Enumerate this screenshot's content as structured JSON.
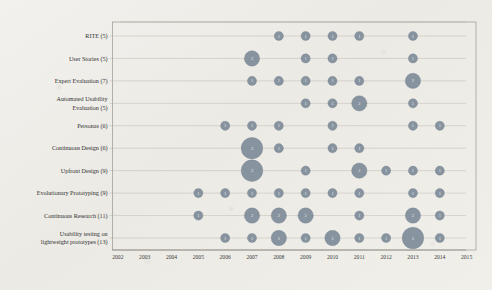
{
  "chart_data": {
    "type": "scatter",
    "subtype": "bubble",
    "title": "",
    "xlabel": "",
    "ylabel": "",
    "grid": true,
    "legend": "none",
    "x_tick_labels": [
      "2002",
      "2003",
      "2004",
      "2005",
      "2006",
      "2007",
      "2008",
      "2009",
      "2010",
      "2011",
      "2012",
      "2013",
      "2014",
      "2015"
    ],
    "xlim": [
      2002,
      2015
    ],
    "categories": [
      "RITE (5)",
      "User Stories (5)",
      "Expert Evaluation (7)",
      "Automated Usability Evaluation (5)",
      "Personas (6)",
      "Continuous Design (6)",
      "Upfront Design (9)",
      "Evolutionary Prototyping (9)",
      "Continuous Research (11)",
      "Usability testing on lightweight prototypes (13)"
    ],
    "category_lines": [
      [
        "RITE (5)"
      ],
      [
        "User Stories (5)"
      ],
      [
        "Expert Evaluation (7)"
      ],
      [
        "Automated Usability",
        "Evaluation (5)"
      ],
      [
        "Personas (6)"
      ],
      [
        "Continuous Design (6)"
      ],
      [
        "Upfront Design (9)"
      ],
      [
        "Evolutionary Prototyping (9)"
      ],
      [
        "Continuous Research (11)"
      ],
      [
        "Usability testing on",
        "lightweight prototypes (13)"
      ]
    ],
    "size_encoding": "count",
    "points": [
      {
        "category": "RITE (5)",
        "year": 2008,
        "count": 1
      },
      {
        "category": "RITE (5)",
        "year": 2009,
        "count": 1
      },
      {
        "category": "RITE (5)",
        "year": 2010,
        "count": 1
      },
      {
        "category": "RITE (5)",
        "year": 2011,
        "count": 1
      },
      {
        "category": "RITE (5)",
        "year": 2013,
        "count": 1
      },
      {
        "category": "User Stories (5)",
        "year": 2007,
        "count": 2
      },
      {
        "category": "User Stories (5)",
        "year": 2009,
        "count": 1
      },
      {
        "category": "User Stories (5)",
        "year": 2010,
        "count": 1
      },
      {
        "category": "User Stories (5)",
        "year": 2013,
        "count": 1
      },
      {
        "category": "Expert Evaluation (7)",
        "year": 2007,
        "count": 1
      },
      {
        "category": "Expert Evaluation (7)",
        "year": 2008,
        "count": 1
      },
      {
        "category": "Expert Evaluation (7)",
        "year": 2009,
        "count": 1
      },
      {
        "category": "Expert Evaluation (7)",
        "year": 2010,
        "count": 1
      },
      {
        "category": "Expert Evaluation (7)",
        "year": 2011,
        "count": 1
      },
      {
        "category": "Expert Evaluation (7)",
        "year": 2013,
        "count": 2
      },
      {
        "category": "Automated Usability Evaluation (5)",
        "year": 2009,
        "count": 1
      },
      {
        "category": "Automated Usability Evaluation (5)",
        "year": 2010,
        "count": 1
      },
      {
        "category": "Automated Usability Evaluation (5)",
        "year": 2011,
        "count": 2
      },
      {
        "category": "Automated Usability Evaluation (5)",
        "year": 2013,
        "count": 1
      },
      {
        "category": "Personas (6)",
        "year": 2006,
        "count": 1
      },
      {
        "category": "Personas (6)",
        "year": 2007,
        "count": 1
      },
      {
        "category": "Personas (6)",
        "year": 2008,
        "count": 1
      },
      {
        "category": "Personas (6)",
        "year": 2010,
        "count": 1
      },
      {
        "category": "Personas (6)",
        "year": 2013,
        "count": 1
      },
      {
        "category": "Personas (6)",
        "year": 2014,
        "count": 1
      },
      {
        "category": "Continuous Design (6)",
        "year": 2007,
        "count": 3
      },
      {
        "category": "Continuous Design (6)",
        "year": 2008,
        "count": 1
      },
      {
        "category": "Continuous Design (6)",
        "year": 2010,
        "count": 1
      },
      {
        "category": "Continuous Design (6)",
        "year": 2011,
        "count": 1
      },
      {
        "category": "Upfront Design (9)",
        "year": 2007,
        "count": 3
      },
      {
        "category": "Upfront Design (9)",
        "year": 2009,
        "count": 1
      },
      {
        "category": "Upfront Design (9)",
        "year": 2011,
        "count": 2
      },
      {
        "category": "Upfront Design (9)",
        "year": 2012,
        "count": 1
      },
      {
        "category": "Upfront Design (9)",
        "year": 2013,
        "count": 1
      },
      {
        "category": "Upfront Design (9)",
        "year": 2014,
        "count": 1
      },
      {
        "category": "Evolutionary Prototyping (9)",
        "year": 2005,
        "count": 1
      },
      {
        "category": "Evolutionary Prototyping (9)",
        "year": 2006,
        "count": 1
      },
      {
        "category": "Evolutionary Prototyping (9)",
        "year": 2007,
        "count": 1
      },
      {
        "category": "Evolutionary Prototyping (9)",
        "year": 2008,
        "count": 1
      },
      {
        "category": "Evolutionary Prototyping (9)",
        "year": 2009,
        "count": 1
      },
      {
        "category": "Evolutionary Prototyping (9)",
        "year": 2010,
        "count": 1
      },
      {
        "category": "Evolutionary Prototyping (9)",
        "year": 2011,
        "count": 1
      },
      {
        "category": "Evolutionary Prototyping (9)",
        "year": 2013,
        "count": 1
      },
      {
        "category": "Evolutionary Prototyping (9)",
        "year": 2014,
        "count": 1
      },
      {
        "category": "Continuous Research (11)",
        "year": 2005,
        "count": 1
      },
      {
        "category": "Continuous Research (11)",
        "year": 2007,
        "count": 2
      },
      {
        "category": "Continuous Research (11)",
        "year": 2008,
        "count": 2
      },
      {
        "category": "Continuous Research (11)",
        "year": 2009,
        "count": 2
      },
      {
        "category": "Continuous Research (11)",
        "year": 2011,
        "count": 1
      },
      {
        "category": "Continuous Research (11)",
        "year": 2013,
        "count": 2
      },
      {
        "category": "Continuous Research (11)",
        "year": 2014,
        "count": 1
      },
      {
        "category": "Usability testing on lightweight prototypes (13)",
        "year": 2006,
        "count": 1
      },
      {
        "category": "Usability testing on lightweight prototypes (13)",
        "year": 2007,
        "count": 1
      },
      {
        "category": "Usability testing on lightweight prototypes (13)",
        "year": 2008,
        "count": 2
      },
      {
        "category": "Usability testing on lightweight prototypes (13)",
        "year": 2009,
        "count": 1
      },
      {
        "category": "Usability testing on lightweight prototypes (13)",
        "year": 2010,
        "count": 2
      },
      {
        "category": "Usability testing on lightweight prototypes (13)",
        "year": 2011,
        "count": 1
      },
      {
        "category": "Usability testing on lightweight prototypes (13)",
        "year": 2012,
        "count": 1
      },
      {
        "category": "Usability testing on lightweight prototypes (13)",
        "year": 2013,
        "count": 3
      },
      {
        "category": "Usability testing on lightweight prototypes (13)",
        "year": 2014,
        "count": 1
      }
    ],
    "colors": {
      "bubble_fill": "#7e8c99",
      "bubble_label": "#e9edf1",
      "gridline": "#b8b4ac",
      "axis": "#8d8a83",
      "text": "#2f2f2f",
      "background": "#efeeea"
    }
  }
}
